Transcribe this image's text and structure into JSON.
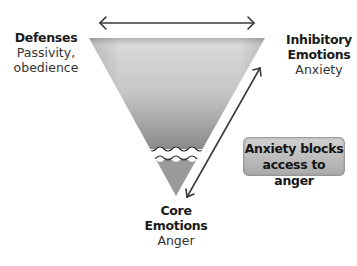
{
  "diagram": {
    "defenses": {
      "heading": "Defenses",
      "lines": [
        "Passivity,",
        "obedience"
      ]
    },
    "inhibitory": {
      "heading_lines": [
        "Inhibitory",
        "Emotions"
      ],
      "example": "Anxiety"
    },
    "core": {
      "heading_lines": [
        "Core",
        "Emotions"
      ],
      "example": "Anger"
    },
    "callout": {
      "lines": [
        "Anxiety blocks",
        "access to anger"
      ]
    },
    "colors": {
      "triangle_top": "#cfcfcf",
      "triangle_bottom": "#8e8e8e",
      "arrow": "#3a3a3a",
      "callout_fill": "#bdbdbd"
    }
  }
}
